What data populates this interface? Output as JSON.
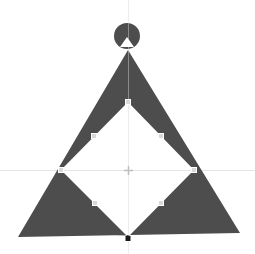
{
  "canvas": {
    "width": 255,
    "height": 254,
    "background": "#ffffff"
  },
  "colors": {
    "fill": "#4d4d4d",
    "guide": "#e4e4e4",
    "handle_fill": "#d9d9d9",
    "handle_stroke": "#ffffff",
    "anchor": "#1a1a1a",
    "crosshair": "#bdbdbd"
  },
  "shape": {
    "name": "Triangle with diamond cutout",
    "outer_triangle": {
      "apex": [
        128,
        50
      ],
      "bottom_left": [
        18,
        237
      ],
      "bottom_right": [
        240,
        233
      ]
    },
    "inner_diamond": {
      "top": [
        128,
        102
      ],
      "left": [
        61,
        170
      ],
      "right": [
        194,
        170
      ],
      "bottom": [
        128,
        237
      ]
    },
    "top_circle": {
      "center": [
        127,
        36
      ],
      "radius": 13,
      "notch": [
        [
          120,
          47
        ],
        [
          127,
          37
        ],
        [
          134,
          47
        ]
      ]
    }
  },
  "guides": {
    "vertical_x": 128,
    "horizontal_y": 170
  },
  "handles": [
    {
      "id": "top-vertex",
      "pos": [
        128,
        102
      ]
    },
    {
      "id": "left-vertex",
      "pos": [
        61,
        170
      ]
    },
    {
      "id": "right-vertex",
      "pos": [
        194,
        170
      ]
    },
    {
      "id": "upper-left-mid",
      "pos": [
        94,
        136
      ]
    },
    {
      "id": "upper-right-mid",
      "pos": [
        161,
        136
      ]
    },
    {
      "id": "lower-left-mid",
      "pos": [
        95,
        203
      ]
    },
    {
      "id": "lower-right-mid",
      "pos": [
        161,
        203
      ]
    }
  ],
  "anchor": {
    "id": "bottom-anchor",
    "pos": [
      128,
      237
    ]
  },
  "center_marker": {
    "pos": [
      128,
      170
    ]
  }
}
